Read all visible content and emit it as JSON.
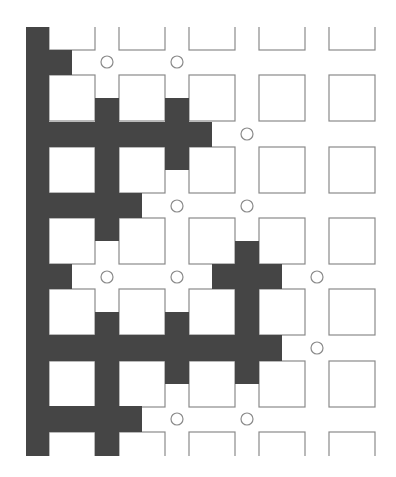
{
  "diagram": {
    "type": "grid-maze-percolation",
    "colors": {
      "background": "#ffffff",
      "square_stroke": "#8a8a8a",
      "dark_fill": "#454545",
      "circle_stroke": "#8a8a8a"
    },
    "grid": {
      "square_columns_x": [
        49,
        119,
        189,
        259,
        329
      ],
      "square_rows_y": [
        4,
        75,
        147,
        218,
        289,
        361,
        432
      ],
      "square_size": 46,
      "clip_top": 27,
      "clip_bottom": 456
    },
    "dark_regions": [
      {
        "x": 26,
        "y": 27,
        "w": 23,
        "h": 429
      },
      {
        "x": 49,
        "y": 50,
        "w": 23,
        "h": 25
      },
      {
        "x": 95,
        "y": 98,
        "w": 24,
        "h": 24
      },
      {
        "x": 165,
        "y": 98,
        "w": 24,
        "h": 24
      },
      {
        "x": 49,
        "y": 122,
        "w": 163,
        "h": 25
      },
      {
        "x": 95,
        "y": 147,
        "w": 24,
        "h": 46
      },
      {
        "x": 165,
        "y": 147,
        "w": 24,
        "h": 23
      },
      {
        "x": 49,
        "y": 193,
        "w": 93,
        "h": 25
      },
      {
        "x": 95,
        "y": 218,
        "w": 24,
        "h": 23
      },
      {
        "x": 235,
        "y": 241,
        "w": 24,
        "h": 23
      },
      {
        "x": 49,
        "y": 264,
        "w": 23,
        "h": 25
      },
      {
        "x": 212,
        "y": 264,
        "w": 70,
        "h": 25
      },
      {
        "x": 235,
        "y": 289,
        "w": 24,
        "h": 46
      },
      {
        "x": 95,
        "y": 312,
        "w": 24,
        "h": 23
      },
      {
        "x": 165,
        "y": 312,
        "w": 24,
        "h": 23
      },
      {
        "x": 49,
        "y": 335,
        "w": 233,
        "h": 26
      },
      {
        "x": 95,
        "y": 361,
        "w": 24,
        "h": 45
      },
      {
        "x": 165,
        "y": 361,
        "w": 24,
        "h": 23
      },
      {
        "x": 235,
        "y": 361,
        "w": 24,
        "h": 23
      },
      {
        "x": 49,
        "y": 406,
        "w": 93,
        "h": 26
      },
      {
        "x": 95,
        "y": 432,
        "w": 24,
        "h": 24
      }
    ],
    "circles": [
      {
        "cx": 107,
        "cy": 62
      },
      {
        "cx": 177,
        "cy": 62
      },
      {
        "cx": 247,
        "cy": 134
      },
      {
        "cx": 177,
        "cy": 206
      },
      {
        "cx": 247,
        "cy": 206
      },
      {
        "cx": 107,
        "cy": 277
      },
      {
        "cx": 177,
        "cy": 277
      },
      {
        "cx": 317,
        "cy": 277
      },
      {
        "cx": 317,
        "cy": 348
      },
      {
        "cx": 177,
        "cy": 419
      },
      {
        "cx": 247,
        "cy": 419
      }
    ],
    "circle_radius": 6
  }
}
